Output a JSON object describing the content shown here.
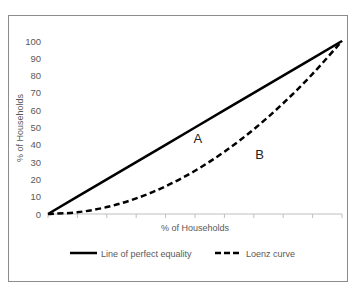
{
  "chart_data": {
    "type": "line",
    "title": "",
    "xlabel": "% of Households",
    "ylabel": "% of Households",
    "ylim": [
      0,
      100
    ],
    "xlim": [
      0,
      100
    ],
    "yticks": [
      0,
      10,
      20,
      30,
      40,
      50,
      60,
      70,
      80,
      90,
      100
    ],
    "xticks_count": 10,
    "x_tick_labels_shown": false,
    "grid": false,
    "legend_position": "bottom",
    "x": [
      0,
      10,
      20,
      30,
      40,
      50,
      60,
      70,
      80,
      90,
      100
    ],
    "series": [
      {
        "name": "Line of perfect equality",
        "style": "solid",
        "color": "#000000",
        "values": [
          0,
          10,
          20,
          30,
          40,
          50,
          60,
          70,
          80,
          90,
          100
        ]
      },
      {
        "name": "Loenz curve",
        "style": "dashed",
        "color": "#000000",
        "values": [
          0,
          1,
          4,
          9,
          16,
          25,
          36,
          49,
          64,
          81,
          100
        ]
      }
    ],
    "annotations": [
      {
        "text": "A",
        "x": 51,
        "y": 41
      },
      {
        "text": "B",
        "x": 72,
        "y": 32
      }
    ]
  }
}
